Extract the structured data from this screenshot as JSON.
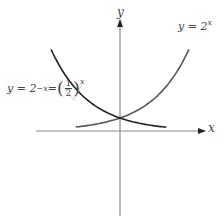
{
  "chart_data": {
    "type": "line",
    "title": "",
    "xlabel": "x",
    "ylabel": "y",
    "grid": false,
    "legend": "none",
    "axes": {
      "x_arrow": true,
      "y_arrow": true,
      "ticks": []
    },
    "series": [
      {
        "name": "y = 2^x",
        "function": "2^x",
        "x": [
          -2,
          -1,
          0,
          1,
          2
        ],
        "values": [
          0.25,
          0.5,
          1,
          2,
          4
        ]
      },
      {
        "name": "y = 2^-x = (1/2)^x",
        "function": "2^-x",
        "x": [
          -2,
          -1,
          0,
          1,
          2
        ],
        "values": [
          4,
          2,
          1,
          0.5,
          0.25
        ]
      }
    ],
    "annotations": [
      {
        "text": "intersection at (0, 1)"
      }
    ]
  },
  "labels": {
    "x_axis": "x",
    "y_axis": "y",
    "growth": {
      "lhs": "y = 2",
      "exp": "x"
    },
    "decay": {
      "lhs": "y = 2",
      "exp": "−x",
      "eq": " = ",
      "num": "1",
      "den": "2",
      "outer_exp": "x"
    }
  },
  "colors": {
    "axis": "#777777",
    "growth_curve": "#555555",
    "decay_curve": "#222222",
    "text": "#444444"
  }
}
